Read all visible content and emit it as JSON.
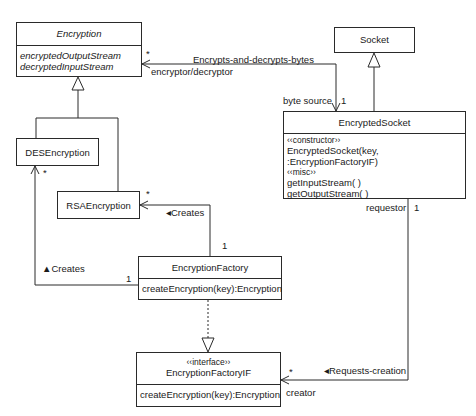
{
  "classes": {
    "encryption": {
      "name": "Encryption",
      "attributes": [
        "encryptedOutputStream",
        "decryptedInputStream"
      ]
    },
    "socket": {
      "name": "Socket"
    },
    "encrypted_socket": {
      "name": "EncryptedSocket",
      "members": [
        "‹‹constructor››",
        "EncryptedSocket(key, :EncryptionFactoryIF)",
        "‹‹misc››",
        "getInputStream( )",
        "getOutputStream( )"
      ]
    },
    "des_encryption": {
      "name": "DESEncryption"
    },
    "rsa_encryption": {
      "name": "RSAEncryption"
    },
    "encryption_factory": {
      "name": "EncryptionFactory",
      "operations": [
        "createEncryption(key):Encryption"
      ]
    },
    "encryption_factory_if": {
      "stereotype": "‹‹interface››",
      "name": "EncryptionFactoryIF",
      "operations": [
        "createEncryption(key):Encryption"
      ]
    }
  },
  "associations": {
    "encrypts": {
      "name": "Encrypts-and-decrypts-bytes",
      "role_encryption": "encryptor/decryptor",
      "mult_encryption": "*",
      "role_socket": "byte source",
      "mult_socket": "1"
    },
    "creates_rsa": {
      "name": "◂Creates",
      "mult_rsa": "*",
      "mult_factory": "1"
    },
    "creates_des": {
      "name": "▲Creates",
      "mult_des": "*",
      "mult_factory": "1"
    },
    "requests_creation": {
      "name": "◂Requests-creation",
      "role_socket": "requestor",
      "mult_socket": "1",
      "role_if": "creator",
      "mult_if": "*"
    }
  },
  "colors": {
    "line": "#2a2a2a",
    "background": "#ffffff",
    "text": "#1a1a1a"
  }
}
